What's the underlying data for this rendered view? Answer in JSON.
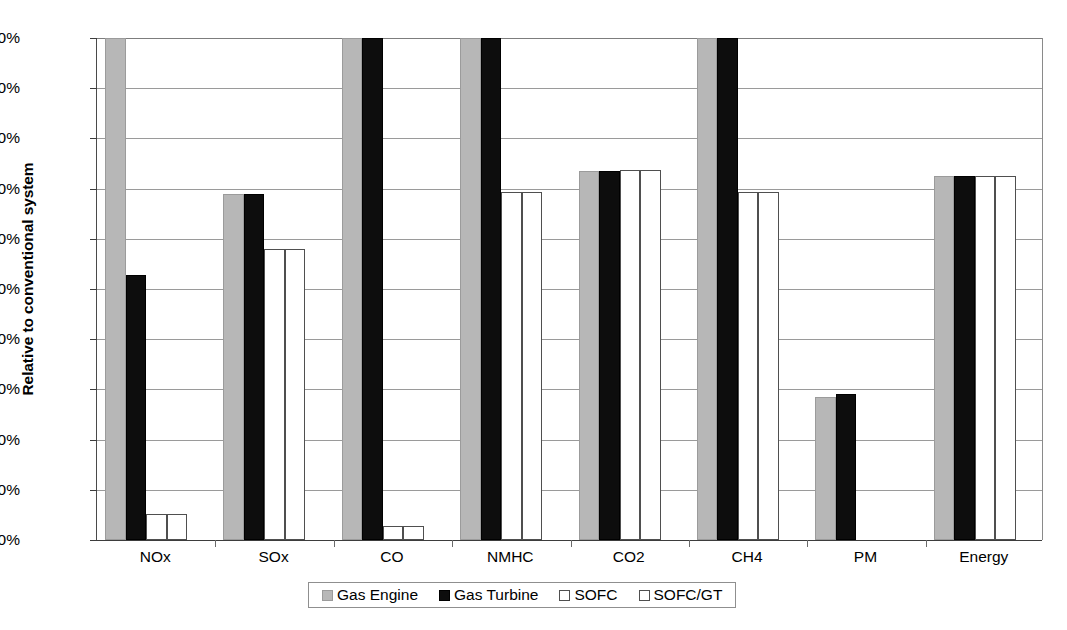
{
  "chart_data": {
    "type": "bar",
    "title": "",
    "xlabel": "",
    "ylabel": "Relative to conventional system",
    "ylim": [
      0,
      100
    ],
    "ytick_labels": [
      "0%",
      "10%",
      "20%",
      "30%",
      "40%",
      "50%",
      "60%",
      "70%",
      "80%",
      "90%",
      "100%"
    ],
    "ytick_values": [
      0,
      10,
      20,
      30,
      40,
      50,
      60,
      70,
      80,
      90,
      100
    ],
    "grid": true,
    "legend_position": "bottom",
    "categories": [
      "NOx",
      "SOx",
      "CO",
      "NMHC",
      "CO2",
      "CH4",
      "PM",
      "Energy"
    ],
    "series": [
      {
        "name": "Gas Engine",
        "color": "#b7b7b7",
        "values": [
          100,
          69,
          100,
          100,
          73.5,
          100,
          28.5,
          72.5
        ]
      },
      {
        "name": "Gas Turbine",
        "color": "#0d0d0d",
        "values": [
          52.8,
          69,
          100,
          100,
          73.5,
          100,
          29,
          72.5
        ]
      },
      {
        "name": "SOFC",
        "color": "#ffffff",
        "values": [
          5.2,
          58,
          2.8,
          69.3,
          73.8,
          69.3,
          0,
          72.5
        ]
      },
      {
        "name": "SOFC/GT",
        "color": "#ffffff",
        "values": [
          5.2,
          58,
          2.8,
          69.3,
          73.8,
          69.3,
          0,
          72.5
        ]
      }
    ]
  },
  "legend": {
    "items": [
      {
        "label": "Gas Engine"
      },
      {
        "label": "Gas Turbine"
      },
      {
        "label": "SOFC"
      },
      {
        "label": "SOFC/GT"
      }
    ]
  }
}
